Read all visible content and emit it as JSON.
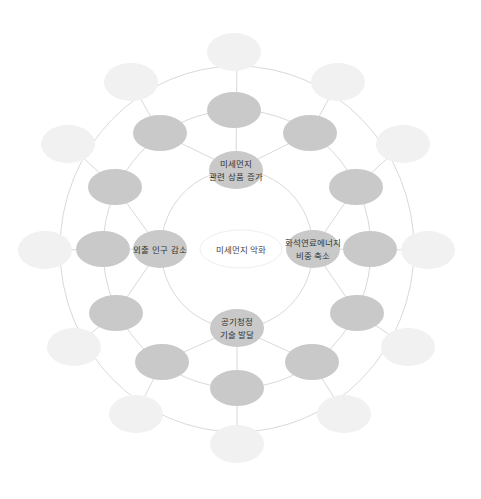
{
  "diagram": {
    "type": "concentric-mind-map",
    "colors": {
      "background": "#ffffff",
      "line": "#d9d9d9",
      "center_fill": "#ffffff",
      "center_stroke": "#eeeeee",
      "inner_fill": "#c9c9c9",
      "middle_fill": "#c9c9c9",
      "outer_fill": "#f1f1f1",
      "text": "#333333"
    },
    "center": {
      "label": "미세먼지 악화"
    },
    "inner_nodes": [
      {
        "id": "top",
        "lines": [
          "미세먼지",
          "관련 상품 증가"
        ]
      },
      {
        "id": "right",
        "lines": [
          "화석연료에너지",
          "비중 축소"
        ]
      },
      {
        "id": "bottom",
        "lines": [
          "공기청정",
          "기술 발달"
        ]
      },
      {
        "id": "left",
        "lines": [
          "외출 인구 감소"
        ]
      }
    ],
    "middle_nodes_count": 12,
    "outer_nodes_count": 12
  }
}
